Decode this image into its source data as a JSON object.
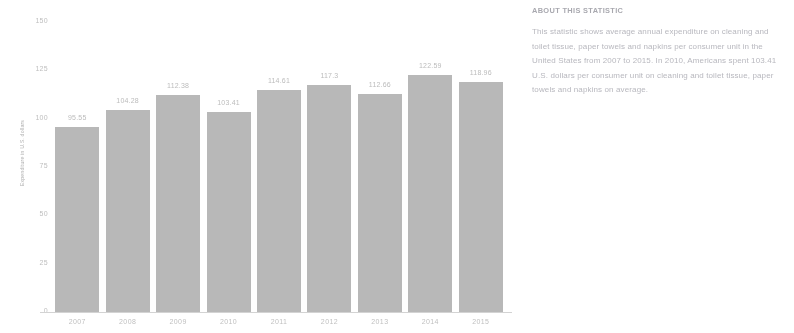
{
  "chart_data": {
    "type": "bar",
    "title": "",
    "xlabel": "",
    "ylabel": "Expenditure in U.S. dollars",
    "categories": [
      "2007",
      "2008",
      "2009",
      "2010",
      "2011",
      "2012",
      "2013",
      "2014",
      "2015"
    ],
    "values": [
      95.55,
      104.28,
      112.38,
      103.41,
      114.61,
      117.3,
      112.66,
      122.59,
      118.96
    ],
    "value_labels": [
      "95.55",
      "104.28",
      "112.38",
      "103.41",
      "114.61",
      "117.3",
      "112.66",
      "122.59",
      "118.96"
    ],
    "ylim": [
      0,
      150
    ],
    "yticks": [
      0,
      25,
      50,
      75,
      100,
      125,
      150
    ],
    "ytick_labels": [
      "0",
      "25",
      "50",
      "75",
      "100",
      "125",
      "150"
    ],
    "grid": false,
    "legend": "none",
    "bar_color": "#aaaaaa"
  },
  "axis": {
    "y_title": "Expenditure in U.S. dollars"
  },
  "about": {
    "heading": "ABOUT THIS STATISTIC",
    "body": "This statistic shows average annual expenditure on cleaning and toilet tissue, paper towels and napkins per consumer unit in the United States from 2007 to 2015. In 2010, Americans spent 103.41 U.S. dollars per consumer unit on cleaning and toilet tissue, paper towels and napkins on average."
  }
}
